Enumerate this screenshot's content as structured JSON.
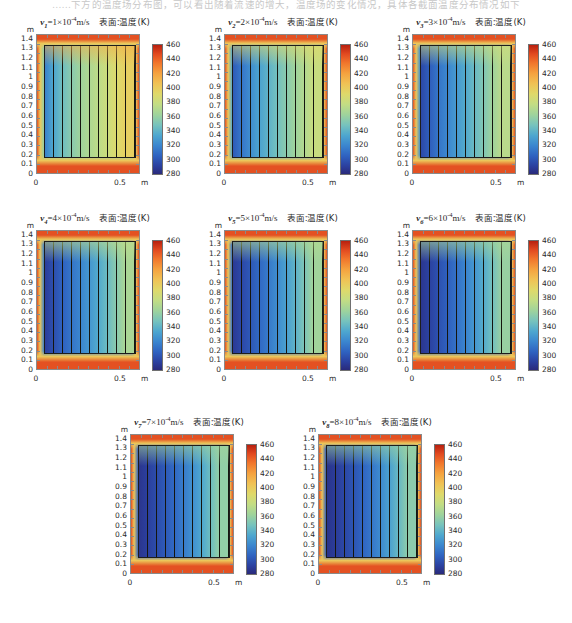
{
  "page": {
    "top_text": "……下方的温度场分布图，可以看出随着流速的增大，温度场的变化情况，具体各截面温度分布情况如下"
  },
  "axis": {
    "y_unit": "m",
    "x_unit": "m",
    "y_ticks": [
      "1.4",
      "1.3",
      "1.2",
      "1.1",
      "1",
      "0.9",
      "0.8",
      "0.7",
      "0.6",
      "0.5",
      "0.4",
      "0.3",
      "0.2",
      "0.1",
      "0"
    ],
    "x_ticks": [
      "0",
      "0.5"
    ],
    "colorbar_ticks": [
      "460",
      "440",
      "420",
      "400",
      "380",
      "360",
      "340",
      "320",
      "300",
      "280"
    ],
    "ylim": [
      0,
      1.45
    ],
    "xlim": [
      0,
      0.62
    ],
    "clim": [
      280,
      470
    ]
  },
  "legend_label": "表面:温度(K)",
  "chart_data": {
    "type": "heatmap",
    "xlabel": "m",
    "ylabel": "m",
    "clabel": "温度 (K)",
    "colorbar_range": [
      280,
      470
    ],
    "colorbar_ticks": [
      460,
      440,
      420,
      400,
      380,
      360,
      340,
      320,
      300,
      280
    ],
    "grid": false,
    "legend_position": "right",
    "panels": [
      {
        "index": 1,
        "velocity_symbol": "v",
        "velocity_sub": "1",
        "velocity_value": "1×10",
        "velocity_exp": "-4",
        "velocity_unit": "m/s",
        "title_suffix": "表面:温度(K)",
        "core_mean_temp": 385,
        "core_left_temp": 330,
        "core_right_temp": 420,
        "jacket_temp": 465,
        "band_temps": [
          330,
          352,
          368,
          380,
          390,
          398,
          406,
          414,
          422,
          430
        ]
      },
      {
        "index": 2,
        "velocity_symbol": "v",
        "velocity_sub": "2",
        "velocity_value": "2×10",
        "velocity_exp": "-4",
        "velocity_unit": "m/s",
        "title_suffix": "表面:温度(K)",
        "core_mean_temp": 355,
        "core_left_temp": 312,
        "core_right_temp": 400,
        "jacket_temp": 465,
        "band_temps": [
          310,
          325,
          338,
          350,
          360,
          370,
          380,
          390,
          400,
          412
        ]
      },
      {
        "index": 3,
        "velocity_symbol": "v",
        "velocity_sub": "3",
        "velocity_value": "3×10",
        "velocity_exp": "-4",
        "velocity_unit": "m/s",
        "title_suffix": "表面:温度(K)",
        "core_mean_temp": 340,
        "core_left_temp": 300,
        "core_right_temp": 390,
        "jacket_temp": 465,
        "band_temps": [
          300,
          312,
          324,
          334,
          344,
          354,
          365,
          376,
          390,
          404
        ]
      },
      {
        "index": 4,
        "velocity_symbol": "v",
        "velocity_sub": "4",
        "velocity_value": "4×10",
        "velocity_exp": "-4",
        "velocity_unit": "m/s",
        "title_suffix": "表面:温度(K)",
        "core_mean_temp": 330,
        "core_left_temp": 295,
        "core_right_temp": 382,
        "jacket_temp": 465,
        "band_temps": [
          294,
          304,
          314,
          324,
          333,
          343,
          354,
          366,
          380,
          396
        ]
      },
      {
        "index": 5,
        "velocity_symbol": "v",
        "velocity_sub": "5",
        "velocity_value": "5×10",
        "velocity_exp": "-4",
        "velocity_unit": "m/s",
        "title_suffix": "表面:温度(K)",
        "core_mean_temp": 324,
        "core_left_temp": 292,
        "core_right_temp": 376,
        "jacket_temp": 465,
        "band_temps": [
          291,
          300,
          309,
          318,
          327,
          337,
          348,
          360,
          374,
          391
        ]
      },
      {
        "index": 6,
        "velocity_symbol": "v",
        "velocity_sub": "6",
        "velocity_value": "6×10",
        "velocity_exp": "-4",
        "velocity_unit": "m/s",
        "title_suffix": "表面:温度(K)",
        "core_mean_temp": 319,
        "core_left_temp": 290,
        "core_right_temp": 371,
        "jacket_temp": 465,
        "band_temps": [
          289,
          297,
          305,
          313,
          322,
          332,
          343,
          355,
          370,
          387
        ]
      },
      {
        "index": 7,
        "velocity_symbol": "v",
        "velocity_sub": "7",
        "velocity_value": "7×10",
        "velocity_exp": "-4",
        "velocity_unit": "m/s",
        "title_suffix": "表面:温度(K)",
        "core_mean_temp": 315,
        "core_left_temp": 288,
        "core_right_temp": 367,
        "jacket_temp": 465,
        "band_temps": [
          288,
          295,
          302,
          310,
          318,
          328,
          339,
          352,
          367,
          384
        ]
      },
      {
        "index": 8,
        "velocity_symbol": "v",
        "velocity_sub": "8",
        "velocity_value": "8×10",
        "velocity_exp": "-4",
        "velocity_unit": "m/s",
        "title_suffix": "表面:温度(K)",
        "core_mean_temp": 312,
        "core_left_temp": 287,
        "core_right_temp": 364,
        "jacket_temp": 465,
        "band_temps": [
          287,
          293,
          300,
          307,
          315,
          325,
          336,
          349,
          364,
          381
        ]
      }
    ]
  }
}
